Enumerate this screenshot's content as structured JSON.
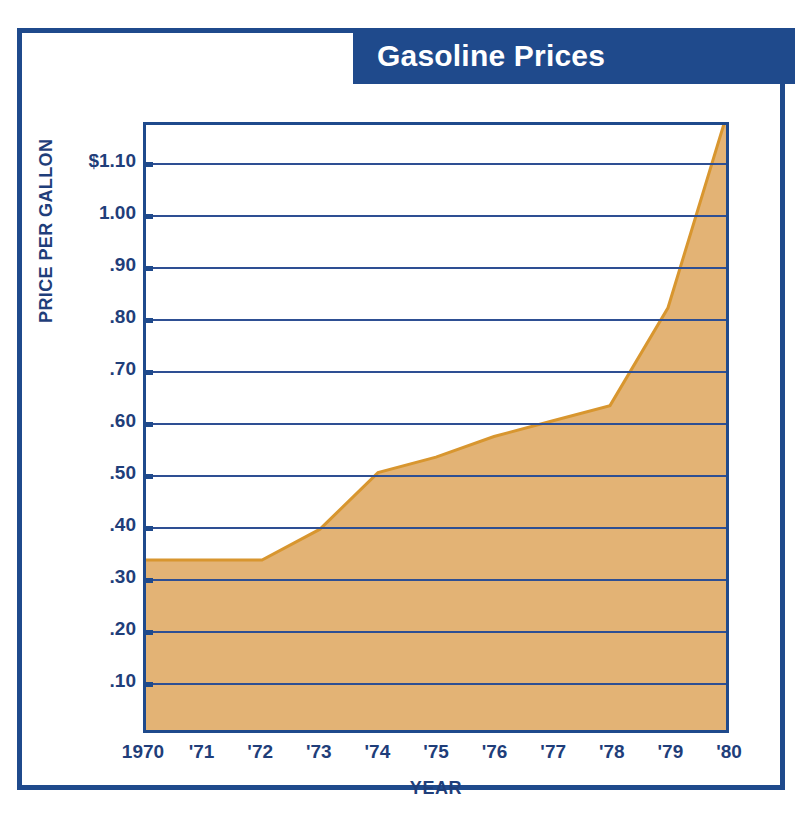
{
  "figure": {
    "title": "Gasoline Prices",
    "frame_color": "#1F4A8C",
    "banner_color": "#1F4A8C",
    "banner_text_color": "#FFFFFF",
    "area_fill_color": "#E3B375",
    "area_line_color": "#D8962F",
    "axis_color": "#1F4A8C",
    "gridline_color": "#2E4F93",
    "label_color": "#1F3E7A"
  },
  "chart_data": {
    "type": "area",
    "title": "Gasoline Prices",
    "xlabel": "YEAR",
    "ylabel": "PRICE PER GALLON",
    "x": [
      1970,
      1971,
      1972,
      1973,
      1974,
      1975,
      1976,
      1977,
      1978,
      1979,
      1980
    ],
    "categories": [
      "1970",
      "'71",
      "'72",
      "'73",
      "'74",
      "'75",
      "'76",
      "'77",
      "'78",
      "'79",
      "'80"
    ],
    "values": [
      0.33,
      0.33,
      0.33,
      0.39,
      0.5,
      0.53,
      0.57,
      0.6,
      0.63,
      0.82,
      1.19
    ],
    "ylim": [
      0,
      1.175
    ],
    "xlim": [
      1970,
      1980
    ],
    "ytick_values": [
      1.1,
      1.0,
      0.9,
      0.8,
      0.7,
      0.6,
      0.5,
      0.4,
      0.3,
      0.2,
      0.1
    ],
    "ytick_labels": [
      "$1.10",
      "1.00",
      ".90",
      ".80",
      ".70",
      ".60",
      ".50",
      ".40",
      ".30",
      ".20",
      ".10"
    ],
    "grid": true,
    "grid_axis": "y",
    "legend": false,
    "legend_position": "none",
    "series": [
      {
        "name": "Price per gallon",
        "values": [
          0.33,
          0.33,
          0.33,
          0.39,
          0.5,
          0.53,
          0.57,
          0.6,
          0.63,
          0.82,
          1.19
        ]
      }
    ]
  }
}
